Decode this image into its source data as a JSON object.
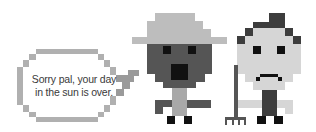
{
  "speech_bubble": {
    "lines": [
      "Sorry pal, your day",
      "in the sun is over."
    ]
  },
  "colors": {
    "light_gray": "#bdbdbd",
    "mid_gray": "#9a9a9a",
    "dark_gray": "#555555",
    "darker_gray": "#3d3d3d",
    "black": "#111111",
    "face_light": "#d6d6d6",
    "background": "#ffffff"
  },
  "characters": [
    {
      "name": "hat-character",
      "description": "character with wide-brim hat, dark face, open mouth"
    },
    {
      "name": "sad-character",
      "description": "character with frown, holding a rake"
    }
  ]
}
